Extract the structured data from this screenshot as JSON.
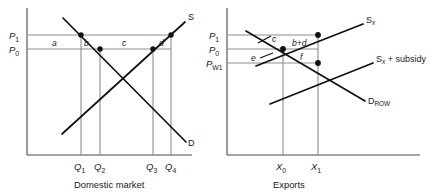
{
  "figure": {
    "type": "economics-diagram",
    "topic": "Export subsidy welfare analysis",
    "panels": 2
  },
  "colors": {
    "curve": "#111111",
    "axis": "#4a4a4a",
    "price_line": "#8d8d8d",
    "drop_line": "#8d8d8d",
    "text": "#1a1a1a",
    "background": "#ffffff"
  },
  "left_panel": {
    "caption": "Domestic market",
    "price_axis": {
      "ticks": [
        {
          "id": "P1",
          "base": "P",
          "sub": "1",
          "y": 35
        },
        {
          "id": "P0",
          "base": "P",
          "sub": "0",
          "y": 49
        }
      ]
    },
    "quantity_axis": {
      "ticks": [
        {
          "id": "Q1",
          "base": "Q",
          "sub": "1",
          "x": 81
        },
        {
          "id": "Q2",
          "base": "Q",
          "sub": "2",
          "x": 100
        },
        {
          "id": "Q3",
          "base": "Q",
          "sub": "3",
          "x": 153
        },
        {
          "id": "Q4",
          "base": "Q",
          "sub": "4",
          "x": 171
        }
      ]
    },
    "curves": [
      {
        "id": "supply",
        "label": "S",
        "slope": "upward"
      },
      {
        "id": "demand",
        "label": "D",
        "slope": "downward"
      }
    ],
    "areas": [
      {
        "id": "a",
        "label": "a"
      },
      {
        "id": "b",
        "label": "b"
      },
      {
        "id": "c",
        "label": "c"
      },
      {
        "id": "d",
        "label": "d"
      }
    ],
    "points": [
      {
        "on": "demand",
        "price": "P1",
        "quantity": "Q1"
      },
      {
        "on": "demand",
        "price": "P0",
        "quantity": "Q2"
      },
      {
        "on": "supply",
        "price": "P0",
        "quantity": "Q3"
      },
      {
        "on": "supply",
        "price": "P1",
        "quantity": "Q4"
      }
    ]
  },
  "right_panel": {
    "caption": "Exports",
    "price_axis": {
      "ticks": [
        {
          "id": "P1",
          "base": "P",
          "sub": "1",
          "y": 35
        },
        {
          "id": "P0",
          "base": "P",
          "sub": "0",
          "y": 49
        },
        {
          "id": "PW1",
          "base": "P",
          "sub": "W1",
          "y": 63
        }
      ]
    },
    "quantity_axis": {
      "ticks": [
        {
          "id": "X0",
          "base": "X",
          "sub": "0",
          "x": 68
        },
        {
          "id": "X1",
          "base": "X",
          "sub": "1",
          "x": 103
        }
      ]
    },
    "curves": [
      {
        "id": "Sx",
        "base": "S",
        "sub": "x",
        "suffix": "",
        "label": "Sx",
        "slope": "upward"
      },
      {
        "id": "Sx_subsidy",
        "base": "S",
        "sub": "x",
        "suffix": " + subsidy",
        "label": "Sx + subsidy",
        "slope": "upward"
      },
      {
        "id": "D_ROW",
        "base": "D",
        "sub": "ROW",
        "suffix": "",
        "label": "DROW",
        "slope": "downward"
      }
    ],
    "areas": [
      {
        "id": "c",
        "label": "c"
      },
      {
        "id": "bd",
        "label": "b+d"
      },
      {
        "id": "e",
        "label": "e"
      },
      {
        "id": "f",
        "label": "f"
      }
    ],
    "points": [
      {
        "on": "Sx",
        "price": "P1",
        "quantity": "X1"
      },
      {
        "on": "Sx_and_DROW",
        "price": "P0",
        "quantity": "X0"
      },
      {
        "on": "Sx_subsidy_and_DROW",
        "price": "PW1",
        "quantity": "X1"
      }
    ]
  }
}
